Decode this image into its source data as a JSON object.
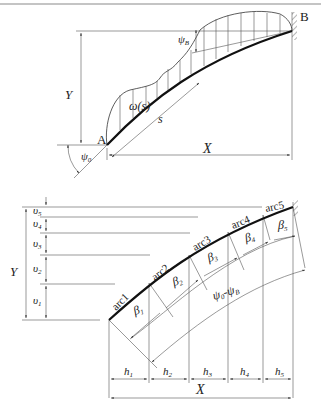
{
  "figure": {
    "top": {
      "point_a": "A",
      "point_b": "B",
      "height_label": "Y",
      "width_label": "X",
      "arc_length_label": "s",
      "load_label": "ω(s)",
      "angle_start": "ψ",
      "angle_start_sub": "0",
      "angle_end": "ψ",
      "angle_end_sub": "B"
    },
    "bottom": {
      "height_label": "Y",
      "width_label": "X",
      "arcs": [
        "arc1",
        "arc2",
        "arc3",
        "arc4",
        "arc5"
      ],
      "v_segments": [
        {
          "sym": "υ",
          "sub": "1"
        },
        {
          "sym": "υ",
          "sub": "2"
        },
        {
          "sym": "υ",
          "sub": "3"
        },
        {
          "sym": "υ",
          "sub": "4"
        },
        {
          "sym": "υ",
          "sub": "5"
        }
      ],
      "h_segments": [
        {
          "sym": "h",
          "sub": "1"
        },
        {
          "sym": "h",
          "sub": "2"
        },
        {
          "sym": "h",
          "sub": "3"
        },
        {
          "sym": "h",
          "sub": "4"
        },
        {
          "sym": "h",
          "sub": "5"
        }
      ],
      "betas": [
        {
          "sym": "β",
          "sub": "1"
        },
        {
          "sym": "β",
          "sub": "2"
        },
        {
          "sym": "β",
          "sub": "3"
        },
        {
          "sym": "β",
          "sub": "4"
        },
        {
          "sym": "β",
          "sub": "5"
        }
      ],
      "total_angle": {
        "sym1": "ψ",
        "sub1": "0",
        "dash": "-",
        "sym2": "ψ",
        "sub2": "B"
      }
    }
  }
}
